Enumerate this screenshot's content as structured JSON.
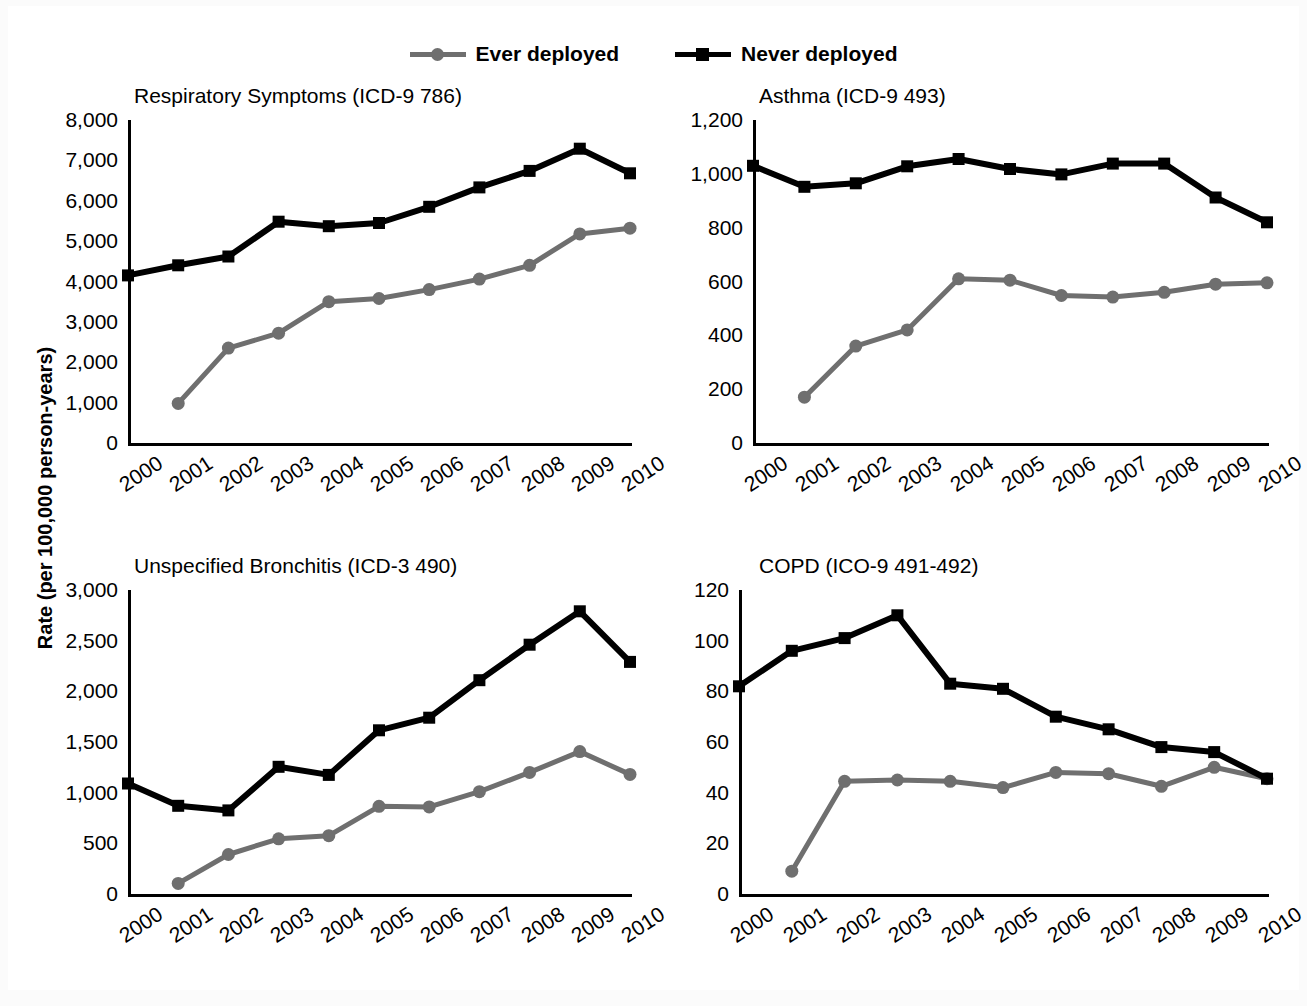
{
  "figure": {
    "ylabel": "Rate (per 100,000 person-years)",
    "legend": [
      {
        "label": "Ever deployed",
        "color": "#6f6f6f",
        "marker": "circle"
      },
      {
        "label": "Never deployed",
        "color": "#000000",
        "marker": "square"
      }
    ]
  },
  "colors": {
    "ever_deployed": "#6f6f6f",
    "never_deployed": "#000000",
    "axis": "#000000",
    "page_background": "#fbfbfb",
    "panel_background": "#ffffff"
  },
  "chart_data": [
    {
      "type": "line",
      "title": "Respiratory Symptoms (ICD-9 786)",
      "xlabel": "",
      "ylabel": "Rate (per 100,000 person-years)",
      "x": [
        "2000",
        "2001",
        "2002",
        "2003",
        "2004",
        "2005",
        "2006",
        "2007",
        "2008",
        "2009",
        "2010"
      ],
      "ylim": [
        0,
        8000
      ],
      "yticks": [
        "0",
        "1,000",
        "2,000",
        "3,000",
        "4,000",
        "5,000",
        "6,000",
        "7,000",
        "8,000"
      ],
      "ytick_values": [
        0,
        1000,
        2000,
        3000,
        4000,
        5000,
        6000,
        7000,
        8000
      ],
      "grid": false,
      "legend_position": "top-center-figure",
      "series": [
        {
          "name": "Ever deployed",
          "color": "#6f6f6f",
          "marker": "circle",
          "values": [
            null,
            980,
            2350,
            2720,
            3500,
            3580,
            3800,
            4060,
            4400,
            5180,
            5320
          ]
        },
        {
          "name": "Never deployed",
          "color": "#000000",
          "marker": "square",
          "values": [
            4150,
            4400,
            4620,
            5480,
            5370,
            5450,
            5850,
            6330,
            6740,
            7290,
            6680
          ]
        }
      ]
    },
    {
      "type": "line",
      "title": "Asthma (ICD-9 493)",
      "xlabel": "",
      "ylabel": "Rate (per 100,000 person-years)",
      "x": [
        "2000",
        "2001",
        "2002",
        "2003",
        "2004",
        "2005",
        "2006",
        "2007",
        "2008",
        "2009",
        "2010"
      ],
      "ylim": [
        0,
        1200
      ],
      "yticks": [
        "0",
        "200",
        "400",
        "600",
        "800",
        "1,000",
        "1,200"
      ],
      "ytick_values": [
        0,
        200,
        400,
        600,
        800,
        1000,
        1200
      ],
      "grid": false,
      "legend_position": "top-center-figure",
      "series": [
        {
          "name": "Ever deployed",
          "color": "#6f6f6f",
          "marker": "circle",
          "values": [
            null,
            170,
            360,
            420,
            610,
            605,
            548,
            542,
            560,
            590,
            595
          ]
        },
        {
          "name": "Never deployed",
          "color": "#000000",
          "marker": "square",
          "values": [
            1030,
            952,
            965,
            1028,
            1055,
            1018,
            998,
            1038,
            1038,
            912,
            820
          ]
        }
      ]
    },
    {
      "type": "line",
      "title": "Unspecified Bronchitis (ICD-3 490)",
      "xlabel": "",
      "ylabel": "Rate (per 100,000 person-years)",
      "x": [
        "2000",
        "2001",
        "2002",
        "2003",
        "2004",
        "2005",
        "2006",
        "2007",
        "2008",
        "2009",
        "2010"
      ],
      "ylim": [
        0,
        3000
      ],
      "yticks": [
        "0",
        "500",
        "1,000",
        "1,500",
        "2,000",
        "2,500",
        "3,000"
      ],
      "ytick_values": [
        0,
        500,
        1000,
        1500,
        2000,
        2500,
        3000
      ],
      "grid": false,
      "legend_position": "top-center-figure",
      "series": [
        {
          "name": "Ever deployed",
          "color": "#6f6f6f",
          "marker": "circle",
          "values": [
            null,
            105,
            390,
            545,
            575,
            865,
            860,
            1010,
            1200,
            1405,
            1180
          ]
        },
        {
          "name": "Never deployed",
          "color": "#000000",
          "marker": "square",
          "values": [
            1090,
            870,
            825,
            1255,
            1175,
            1615,
            1740,
            2110,
            2460,
            2790,
            2290
          ]
        }
      ]
    },
    {
      "type": "line",
      "title": "COPD (ICO-9 491-492)",
      "xlabel": "",
      "ylabel": "Rate (per 100,000 person-years)",
      "x": [
        "2000",
        "2001",
        "2002",
        "2003",
        "2004",
        "2005",
        "2006",
        "2007",
        "2008",
        "2009",
        "2010"
      ],
      "ylim": [
        0,
        120
      ],
      "yticks": [
        "0",
        "20",
        "40",
        "60",
        "80",
        "100",
        "120"
      ],
      "ytick_values": [
        0,
        20,
        40,
        60,
        80,
        100,
        120
      ],
      "grid": false,
      "legend_position": "top-center-figure",
      "series": [
        {
          "name": "Ever deployed",
          "color": "#6f6f6f",
          "marker": "circle",
          "values": [
            null,
            9,
            44.5,
            45,
            44.5,
            42,
            48,
            47.5,
            42.5,
            50,
            45.5
          ]
        },
        {
          "name": "Never deployed",
          "color": "#000000",
          "marker": "square",
          "values": [
            82,
            96,
            101,
            110,
            83,
            81,
            70,
            65,
            58,
            56,
            45.5
          ]
        }
      ]
    }
  ]
}
